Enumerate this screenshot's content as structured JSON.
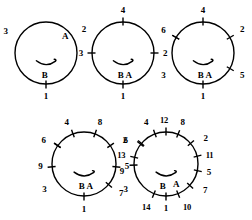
{
  "diagram": {
    "background_color": "#ffffff",
    "stroke_color": "#000000",
    "figures": [
      {
        "id": "figure-1",
        "cx": 46,
        "cy": 53,
        "r": 31,
        "tick_count": 3,
        "inner_labels": [
          {
            "text": "A",
            "x": 0.62,
            "y": -0.56
          },
          {
            "text": "B",
            "x": -0.04,
            "y": 0.72
          }
        ],
        "ticks": [
          {
            "label": "1",
            "angle": 90,
            "has_tick": true,
            "lx": 0.0,
            "ly": 1.38
          },
          {
            "label": "2",
            "angle": -35,
            "has_tick": false,
            "lx": 1.22,
            "ly": -0.78
          },
          {
            "label": "3",
            "angle": 215,
            "has_tick": false,
            "lx": -1.3,
            "ly": -0.72
          }
        ]
      },
      {
        "id": "figure-2",
        "cx": 123,
        "cy": 53,
        "r": 31,
        "tick_count": 4,
        "inner_labels": [
          {
            "text": "B A",
            "x": 0.06,
            "y": 0.72
          }
        ],
        "ticks": [
          {
            "label": "1",
            "angle": 90,
            "has_tick": true,
            "lx": 0.0,
            "ly": 1.4
          },
          {
            "label": "2",
            "angle": 0,
            "has_tick": true,
            "lx": 1.36,
            "ly": 0.0
          },
          {
            "label": "3",
            "angle": 180,
            "has_tick": true,
            "lx": -1.36,
            "ly": 0.0
          },
          {
            "label": "4",
            "angle": 270,
            "has_tick": true,
            "lx": 0.0,
            "ly": -1.4
          }
        ]
      },
      {
        "id": "figure-3",
        "cx": 203,
        "cy": 53,
        "r": 31,
        "tick_count": 6,
        "inner_labels": [
          {
            "text": "B A",
            "x": 0.06,
            "y": 0.72
          }
        ],
        "ticks": [
          {
            "label": "1",
            "angle": 90,
            "has_tick": true,
            "lx": 0.0,
            "ly": 1.4
          },
          {
            "label": "2",
            "angle": -30,
            "has_tick": true,
            "lx": 1.26,
            "ly": -0.76
          },
          {
            "label": "3",
            "angle": 210,
            "has_tick": true,
            "lx": -1.28,
            "ly": 0.7
          },
          {
            "label": "4",
            "angle": 270,
            "has_tick": true,
            "lx": 0.0,
            "ly": -1.4
          },
          {
            "label": "5",
            "angle": 30,
            "has_tick": true,
            "lx": 1.26,
            "ly": 0.72
          },
          {
            "label": "6",
            "angle": 210,
            "has_tick": true,
            "lx": -1.28,
            "ly": -0.74
          }
        ]
      },
      {
        "id": "figure-4",
        "cx": 84,
        "cy": 164,
        "r": 32,
        "tick_count": 9,
        "inner_labels": [
          {
            "text": "B A",
            "x": 0.06,
            "y": 0.7
          }
        ],
        "ticks": [
          {
            "label": "1",
            "angle": 90,
            "has_tick": true,
            "lx": 0.0,
            "ly": 1.4
          },
          {
            "label": "2",
            "angle": -35,
            "has_tick": true,
            "lx": 1.28,
            "ly": -0.74
          },
          {
            "label": "3",
            "angle": 215,
            "has_tick": true,
            "lx": -1.24,
            "ly": 0.78
          },
          {
            "label": "4",
            "angle": 250,
            "has_tick": true,
            "lx": -0.54,
            "ly": -1.32
          },
          {
            "label": "5",
            "angle": 5,
            "has_tick": true,
            "lx": 1.34,
            "ly": 0.06
          },
          {
            "label": "6",
            "angle": 215,
            "has_tick": true,
            "lx": -1.26,
            "ly": -0.76
          },
          {
            "label": "7",
            "angle": 40,
            "has_tick": true,
            "lx": 1.16,
            "ly": 0.92
          },
          {
            "label": "8",
            "angle": 290,
            "has_tick": true,
            "lx": 0.5,
            "ly": -1.32
          },
          {
            "label": "9",
            "angle": 175,
            "has_tick": true,
            "lx": -1.36,
            "ly": 0.06
          }
        ]
      },
      {
        "id": "figure-5",
        "cx": 166,
        "cy": 164,
        "r": 32,
        "tick_count": 14,
        "inner_labels": [
          {
            "text": "B",
            "x": -0.1,
            "y": 0.7
          },
          {
            "text": "A",
            "x": 0.32,
            "y": 0.62
          }
        ],
        "ticks": [
          {
            "label": "1",
            "angle": 90,
            "has_tick": true,
            "lx": 0.0,
            "ly": 1.38
          },
          {
            "label": "2",
            "angle": -40,
            "has_tick": true,
            "lx": 1.24,
            "ly": -0.8
          },
          {
            "label": "3",
            "angle": 218,
            "has_tick": true,
            "lx": -1.26,
            "ly": 0.78
          },
          {
            "label": "4",
            "angle": 250,
            "has_tick": true,
            "lx": -0.62,
            "ly": -1.3
          },
          {
            "label": "5",
            "angle": 12,
            "has_tick": true,
            "lx": 1.34,
            "ly": 0.26
          },
          {
            "label": "6",
            "angle": 220,
            "has_tick": true,
            "lx": -1.26,
            "ly": -0.74
          },
          {
            "label": "7",
            "angle": 42,
            "has_tick": true,
            "lx": 1.22,
            "ly": 0.8
          },
          {
            "label": "8",
            "angle": 292,
            "has_tick": true,
            "lx": 0.52,
            "ly": -1.3
          },
          {
            "label": "9",
            "angle": 178,
            "has_tick": true,
            "lx": -1.38,
            "ly": 0.22
          },
          {
            "label": "10",
            "angle": 68,
            "has_tick": true,
            "lx": 0.66,
            "ly": 1.34
          },
          {
            "label": "11",
            "angle": -14,
            "has_tick": true,
            "lx": 1.36,
            "ly": -0.28
          },
          {
            "label": "12",
            "angle": 270,
            "has_tick": true,
            "lx": -0.06,
            "ly": -1.38
          },
          {
            "label": "13",
            "angle": 192,
            "has_tick": true,
            "lx": -1.4,
            "ly": -0.28
          },
          {
            "label": "14",
            "angle": 112,
            "has_tick": true,
            "lx": -0.62,
            "ly": 1.34
          }
        ]
      }
    ]
  }
}
